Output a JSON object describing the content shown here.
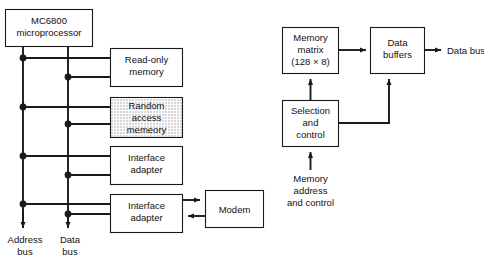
{
  "diagram": {
    "colors": {
      "ink": "#1a1a1a",
      "background": "#ffffff",
      "shaded_fill": "#d9d9d9"
    },
    "left_section": {
      "cpu": {
        "line1": "MC6800",
        "line2": "microprocessor"
      },
      "peripherals": [
        {
          "id": "rom",
          "line1": "Read-only",
          "line2": "memory",
          "shaded": false
        },
        {
          "id": "ram",
          "line1": "Random",
          "line2": "access",
          "line3": "memeory",
          "shaded": true
        },
        {
          "id": "interface-adapter-1",
          "line1": "Interface",
          "line2": "adapter",
          "shaded": false
        },
        {
          "id": "interface-adapter-2",
          "line1": "Interface",
          "line2": "adapter",
          "shaded": false
        }
      ],
      "modem": {
        "label": "Modem"
      },
      "bus_labels": [
        {
          "id": "address-bus",
          "line1": "Address",
          "line2": "bus"
        },
        {
          "id": "data-bus",
          "line1": "Data",
          "line2": "bus"
        }
      ]
    },
    "right_section": {
      "memory_matrix": {
        "line1": "Memory",
        "line2": "matrix",
        "line3": "(128 × 8)"
      },
      "data_buffers": {
        "line1": "Data",
        "line2": "buffers"
      },
      "selection_and_control": {
        "line1": "Selection",
        "line2": "and",
        "line3": "control"
      },
      "output_label": "Data bus",
      "input_label": {
        "line1": "Memory",
        "line2": "address",
        "line3": "and control"
      }
    }
  }
}
